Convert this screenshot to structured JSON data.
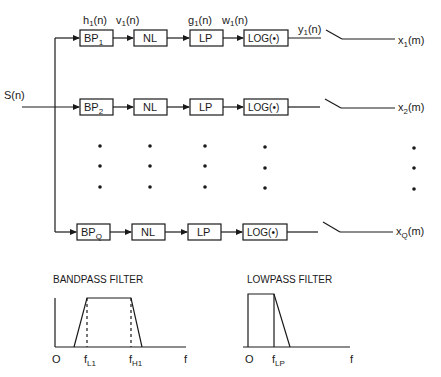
{
  "input": {
    "label": "S(n)"
  },
  "channels": [
    {
      "bp": "BP",
      "bp_sub": "1",
      "nl": "NL",
      "lp": "LP",
      "log": "LOG(•)",
      "h": "h",
      "h_sub": "1",
      "v": "v",
      "v_sub": "1",
      "g": "g",
      "g_sub": "1",
      "w": "w",
      "w_sub": "1",
      "y": "y",
      "y_sub": "1",
      "sig_suffix": "(n)",
      "out": "x",
      "out_sub": "1",
      "out_suffix": "(m)"
    },
    {
      "bp": "BP",
      "bp_sub": "2",
      "nl": "NL",
      "lp": "LP",
      "log": "LOG(•)",
      "out": "x",
      "out_sub": "2",
      "out_suffix": "(m)"
    },
    {
      "bp": "BP",
      "bp_sub": "Q",
      "nl": "NL",
      "lp": "LP",
      "log": "LOG(•)",
      "out": "x",
      "out_sub": "Q",
      "out_suffix": "(m)"
    }
  ],
  "bandpass": {
    "title": "BANDPASS FILTER",
    "origin": "O",
    "fl": "f",
    "fl_sub": "L1",
    "fh": "f",
    "fh_sub": "H1",
    "f": "f"
  },
  "lowpass": {
    "title": "LOWPASS FILTER",
    "origin": "O",
    "flp": "f",
    "flp_sub": "LP",
    "f": "f"
  },
  "colors": {
    "ink": "#1a1a1a",
    "background": "#ffffff"
  }
}
